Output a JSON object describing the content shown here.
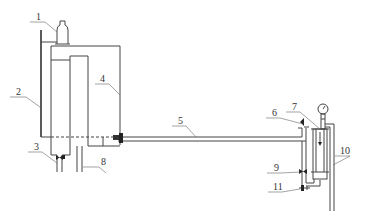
{
  "diagram": {
    "title": "",
    "labels": [
      {
        "id": "1",
        "text": "1",
        "x": 36,
        "y": 20,
        "target": "bottle"
      },
      {
        "id": "2",
        "text": "2",
        "x": 16,
        "y": 96,
        "target": "vertical-rod"
      },
      {
        "id": "3",
        "text": "3",
        "x": 34,
        "y": 150,
        "target": "drain-valve"
      },
      {
        "id": "4",
        "text": "4",
        "x": 100,
        "y": 82,
        "target": "tank"
      },
      {
        "id": "5",
        "text": "5",
        "x": 178,
        "y": 124,
        "target": "horizontal-pipe"
      },
      {
        "id": "6",
        "text": "6",
        "x": 274,
        "y": 116,
        "target": "vent-valve"
      },
      {
        "id": "7",
        "text": "7",
        "x": 294,
        "y": 110,
        "target": "pressure-gauge"
      },
      {
        "id": "8",
        "text": "8",
        "x": 103,
        "y": 165,
        "target": "outlet-pipe"
      },
      {
        "id": "9",
        "text": "9",
        "x": 276,
        "y": 171,
        "target": "control-valve"
      },
      {
        "id": "10",
        "text": "10",
        "x": 340,
        "y": 154,
        "target": "return-pipe"
      },
      {
        "id": "11",
        "text": "11",
        "x": 275,
        "y": 190,
        "target": "bottom-valve"
      }
    ],
    "colors": {
      "line": "#444444",
      "label": "#333333",
      "background": "#ffffff"
    }
  }
}
